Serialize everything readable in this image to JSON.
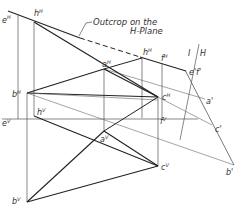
{
  "figure": {
    "title": "Outcrop on the H-Plane",
    "annotation_line1": "Outcrop on the",
    "annotation_line2": "H-Plane",
    "fold_label_left": "I",
    "fold_label_right": "H",
    "colors": {
      "ink": "#222222",
      "thin": "#555555",
      "bg": "#ffffff"
    }
  },
  "labels": {
    "eH": {
      "base": "e",
      "sup": "H"
    },
    "hH1": {
      "base": "h",
      "sup": "H"
    },
    "aH": {
      "base": "a",
      "sup": "H"
    },
    "hH2": {
      "base": "h",
      "sup": "H"
    },
    "fH": {
      "base": "f",
      "sup": "H"
    },
    "bH": {
      "base": "b",
      "sup": "H"
    },
    "cH": {
      "base": "c",
      "sup": "H"
    },
    "ef1": {
      "base": "e'f'"
    },
    "a1": {
      "base": "a'"
    },
    "c1": {
      "base": "c'"
    },
    "b1": {
      "base": "b'"
    },
    "eV": {
      "base": "e",
      "sup": "V"
    },
    "hV": {
      "base": "h",
      "sup": "V"
    },
    "fV": {
      "base": "f",
      "sup": "V"
    },
    "aV": {
      "base": "a",
      "sup": "V"
    },
    "cV": {
      "base": "c",
      "sup": "V"
    },
    "bV": {
      "base": "b",
      "sup": "V"
    }
  }
}
